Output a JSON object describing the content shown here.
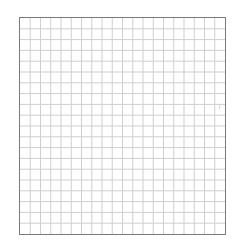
{
  "grid": {
    "columns": 20,
    "rows": 20,
    "border_color": "#7a7a7a",
    "line_color": "#cfcfcf",
    "background_color": "#ffffff"
  }
}
